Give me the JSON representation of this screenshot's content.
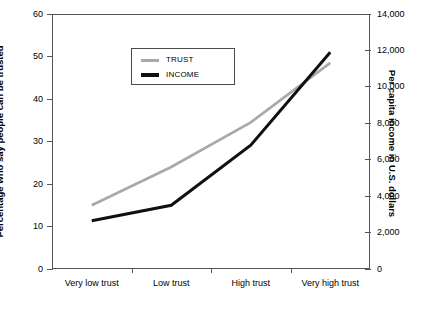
{
  "chart_data": {
    "type": "line",
    "title": "",
    "categories": [
      "Very low trust",
      "Low trust",
      "High trust",
      "Very high trust"
    ],
    "xlabel": "",
    "grid": false,
    "legend_position": "upper-left",
    "axes": {
      "left": {
        "label": "Percentage who say people can be trusted",
        "ticks": [
          0,
          10,
          20,
          30,
          40,
          50,
          60
        ],
        "tick_labels": [
          "0",
          "10",
          "20",
          "30",
          "40",
          "50",
          "60"
        ],
        "lim": [
          0,
          60
        ]
      },
      "right": {
        "label": "Per capita income in U.S. dollars",
        "ticks": [
          0,
          2000,
          4000,
          6000,
          8000,
          10000,
          12000,
          14000
        ],
        "tick_labels": [
          "0",
          "2,000",
          "4,000",
          "6,000",
          "8,000",
          "10,000",
          "12,000",
          "14,000"
        ],
        "lim": [
          0,
          14000
        ]
      }
    },
    "series": [
      {
        "name": "TRUST",
        "axis": "left",
        "color": "#a9a9a9",
        "width": 2.6,
        "values": [
          15,
          24,
          34.5,
          48.5
        ]
      },
      {
        "name": "INCOME",
        "axis": "right",
        "color": "#101010",
        "width": 3.0,
        "values": [
          2650,
          3500,
          6800,
          11900
        ]
      }
    ]
  },
  "legend": {
    "entries": [
      {
        "label": "TRUST"
      },
      {
        "label": "INCOME"
      }
    ]
  },
  "colors": {
    "trust": "#a9a9a9",
    "income": "#101010",
    "axis": "#555555",
    "background": "#ffffff"
  }
}
